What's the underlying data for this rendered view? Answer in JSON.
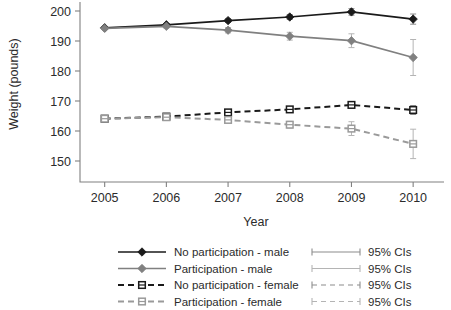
{
  "chart_data": {
    "type": "line",
    "title": "",
    "xlabel": "Year",
    "ylabel": "Weight (pounds)",
    "x": [
      2005,
      2006,
      2007,
      2008,
      2009,
      2010
    ],
    "xtick_labels": [
      "2005",
      "2006",
      "2007",
      "2008",
      "2009",
      "2010"
    ],
    "ytick_labels": [
      "150",
      "160",
      "170",
      "180",
      "190",
      "200"
    ],
    "yticks": [
      150,
      160,
      170,
      180,
      190,
      200
    ],
    "ylim": [
      143,
      203
    ],
    "xlim": [
      2004.6,
      2010.5
    ],
    "grid": false,
    "legend_position": "bottom",
    "error_bars": "95% CIs",
    "series": [
      {
        "name": "No participation - male",
        "color": "#1a1a1a",
        "dash": "solid",
        "marker": "filled-diamond",
        "values": [
          194.4,
          195.4,
          196.8,
          198.0,
          199.7,
          197.3
        ],
        "ci_low": [
          194.4,
          195.0,
          196.2,
          197.2,
          198.6,
          195.6
        ],
        "ci_high": [
          194.4,
          195.8,
          197.4,
          198.8,
          200.8,
          199.0
        ]
      },
      {
        "name": "Participation - male",
        "color": "#808080",
        "dash": "solid",
        "marker": "filled-diamond",
        "values": [
          194.2,
          194.9,
          193.6,
          191.6,
          190.1,
          184.5
        ],
        "ci_low": [
          194.2,
          194.3,
          192.7,
          190.3,
          187.8,
          178.5
        ],
        "ci_high": [
          194.2,
          195.5,
          194.5,
          192.9,
          192.4,
          190.5
        ]
      },
      {
        "name": "No participation - female",
        "color": "#1a1a1a",
        "dash": "dashed",
        "marker": "open-square",
        "values": [
          164.1,
          164.8,
          166.2,
          167.2,
          168.7,
          167.0
        ],
        "ci_low": [
          164.1,
          164.4,
          165.7,
          166.5,
          167.8,
          165.5
        ],
        "ci_high": [
          164.1,
          165.2,
          166.7,
          167.9,
          169.6,
          168.5
        ]
      },
      {
        "name": "Participation - female",
        "color": "#9a9a9a",
        "dash": "dashed",
        "marker": "open-square",
        "values": [
          164.1,
          164.6,
          163.7,
          162.1,
          160.8,
          155.7
        ],
        "ci_low": [
          164.1,
          164.1,
          163.0,
          161.0,
          158.5,
          150.8
        ],
        "ci_high": [
          164.1,
          165.1,
          164.4,
          163.2,
          163.1,
          160.6
        ]
      }
    ]
  },
  "legend": {
    "entries": [
      {
        "label": "No participation - male",
        "ci_label": "95% CIs"
      },
      {
        "label": "Participation - male",
        "ci_label": "95% CIs"
      },
      {
        "label": "No participation - female",
        "ci_label": "95% CIs"
      },
      {
        "label": "Participation - female",
        "ci_label": "95% CIs"
      }
    ]
  },
  "colors": {
    "dark": "#1a1a1a",
    "gray": "#808080",
    "light_gray": "#9a9a9a",
    "axis": "#808080",
    "background": "#ffffff"
  }
}
